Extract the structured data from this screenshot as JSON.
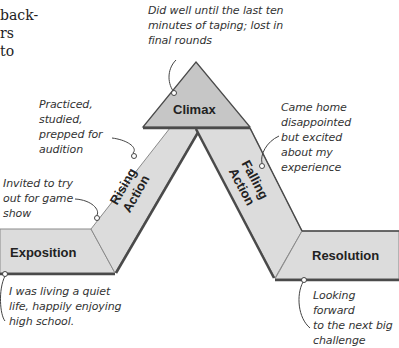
{
  "fragment": {
    "lines": [
      "back-",
      "rs",
      "to"
    ]
  },
  "stages": {
    "exposition": {
      "label": "Exposition",
      "note_lines": [
        "I was living a quiet",
        "life, happily enjoying",
        "high school."
      ]
    },
    "rising": {
      "label_line1": "Rising",
      "label_line2": "Action",
      "notes": [
        {
          "lines": [
            "Invited to try",
            "out for game",
            "show"
          ]
        },
        {
          "lines": [
            "Practiced,",
            "studied,",
            "prepped for",
            "audition"
          ]
        }
      ]
    },
    "climax": {
      "label": "Climax",
      "note_lines": [
        "Did well until the last ten",
        "minutes of taping; lost in",
        "final rounds"
      ]
    },
    "falling": {
      "label_line1": "Falling",
      "label_line2": "Action",
      "note_lines": [
        "Came home",
        "disappointed",
        "but excited",
        "about my",
        "experience"
      ]
    },
    "resolution": {
      "label": "Resolution",
      "note_lines": [
        "Looking forward",
        "to the next big",
        "challenge"
      ]
    }
  },
  "colors": {
    "band_fill": "#dcdcdc",
    "climax_fill": "#c6c6c6",
    "edge": "#4a4a4a",
    "shadow": "#8a8a8a"
  }
}
